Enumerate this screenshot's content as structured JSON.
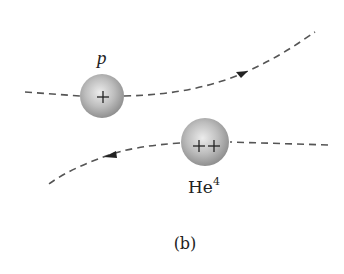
{
  "figure": {
    "caption": "(b)",
    "background": "#ffffff",
    "colors": {
      "trajectory": "#555555",
      "sphere_light": "#e6e6e6",
      "sphere_mid": "#b5b5b5",
      "sphere_dark": "#8a8a8a",
      "text": "#222222"
    }
  },
  "particles": [
    {
      "id": "proton",
      "label": "p",
      "charge_symbols": "+",
      "charge_count": 1,
      "center": [
        102,
        96
      ],
      "radius": 22
    },
    {
      "id": "helium",
      "label_base": "He",
      "label_superscript": "4",
      "charge_symbols": "++",
      "charge_count": 2,
      "center": [
        205,
        142
      ],
      "radius": 24
    }
  ],
  "trajectories": [
    {
      "id": "proton-path",
      "direction": "left-to-right, curving upward",
      "start": [
        25,
        92
      ],
      "end": [
        315,
        32
      ]
    },
    {
      "id": "helium-path",
      "direction": "right-to-left, curving downward",
      "start": [
        328,
        145
      ],
      "end": [
        49,
        184
      ]
    }
  ]
}
